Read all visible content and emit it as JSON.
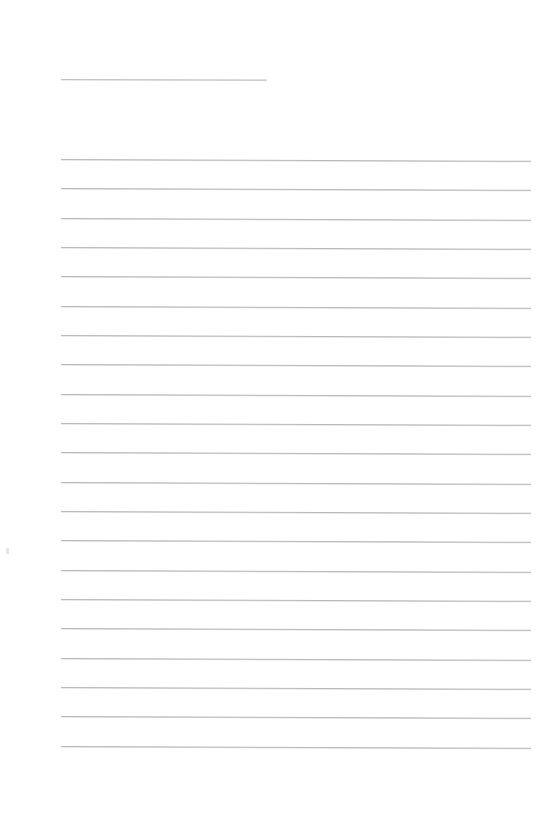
{
  "document": {
    "kind": "scanned-blank-ruled-sheet",
    "page_width": 546,
    "page_height": 817,
    "background_color": "#ffffff",
    "visible_text": "",
    "title_text": "",
    "body_text": ""
  },
  "ink": {
    "rule_color": "#b9b9bd",
    "title_rule_color": "#c2c2c6",
    "speck_color": "#e2e2e4"
  },
  "title_rule": {
    "name": "title-rule",
    "x": 61,
    "y": 79,
    "width": 206,
    "thickness": 1,
    "skew_deg": 0.12,
    "written_text": ""
  },
  "body_rules": {
    "name": "body-rule-set",
    "count": 21,
    "x": 61,
    "width": 470,
    "first_y": 159,
    "spacing": 29.3,
    "thickness": 1,
    "skew_deg": 0.22,
    "lines": [
      {
        "index": 1,
        "y": 159,
        "written_text": ""
      },
      {
        "index": 2,
        "y": 188,
        "written_text": ""
      },
      {
        "index": 3,
        "y": 218,
        "written_text": ""
      },
      {
        "index": 4,
        "y": 247,
        "written_text": ""
      },
      {
        "index": 5,
        "y": 276,
        "written_text": ""
      },
      {
        "index": 6,
        "y": 306,
        "written_text": ""
      },
      {
        "index": 7,
        "y": 335,
        "written_text": ""
      },
      {
        "index": 8,
        "y": 364,
        "written_text": ""
      },
      {
        "index": 9,
        "y": 394,
        "written_text": ""
      },
      {
        "index": 10,
        "y": 423,
        "written_text": ""
      },
      {
        "index": 11,
        "y": 452,
        "written_text": ""
      },
      {
        "index": 12,
        "y": 482,
        "written_text": ""
      },
      {
        "index": 13,
        "y": 511,
        "written_text": ""
      },
      {
        "index": 14,
        "y": 540,
        "written_text": ""
      },
      {
        "index": 15,
        "y": 570,
        "written_text": ""
      },
      {
        "index": 16,
        "y": 599,
        "written_text": ""
      },
      {
        "index": 17,
        "y": 628,
        "written_text": ""
      },
      {
        "index": 18,
        "y": 658,
        "written_text": ""
      },
      {
        "index": 19,
        "y": 687,
        "written_text": ""
      },
      {
        "index": 20,
        "y": 716,
        "written_text": ""
      },
      {
        "index": 21,
        "y": 746,
        "written_text": ""
      }
    ]
  },
  "artifacts": [
    {
      "name": "scan-speck",
      "x": 6,
      "y": 548,
      "width": 3,
      "height": 6
    }
  ],
  "margins": {
    "left": 61,
    "right": 15,
    "top": 79,
    "bottom": 71
  }
}
